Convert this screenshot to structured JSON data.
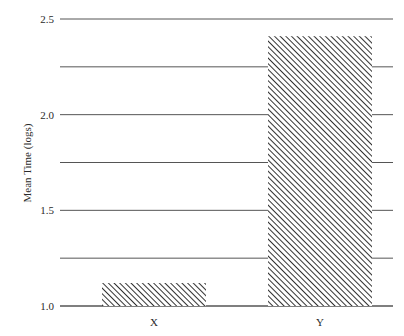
{
  "chart_data": {
    "type": "bar",
    "title": "",
    "xlabel": "",
    "ylabel": "Mean Time (logs)",
    "categories": [
      "X",
      "Y"
    ],
    "values": [
      1.12,
      2.41
    ],
    "ylim": [
      1.0,
      2.5
    ],
    "yticks": [
      1.0,
      1.25,
      1.5,
      1.75,
      2.0,
      2.25,
      2.5
    ],
    "ytick_labels": [
      "1.0",
      "",
      "1.5",
      "",
      "2.0",
      "",
      "2.5"
    ],
    "grid": true,
    "legend": "none",
    "bar_fill": "diagonal-hatch",
    "colors": {
      "bar": "#333333",
      "grid": "#555555",
      "text": "#2a2a2a"
    }
  }
}
